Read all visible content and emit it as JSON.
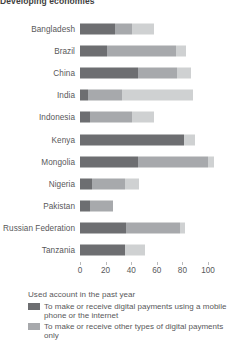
{
  "chart_data": {
    "type": "bar",
    "title": "Developing economies",
    "orientation": "horizontal",
    "stacked": true,
    "xlabel": "",
    "ylabel": "",
    "xlim": [
      0,
      100
    ],
    "xticks": [
      0,
      20,
      40,
      60,
      80,
      100
    ],
    "grid": false,
    "legend_position": "bottom-left",
    "legend_title": "Used account in the past year",
    "categories": [
      "Bangladesh",
      "Brazil",
      "China",
      "India",
      "Indonesia",
      "Kenya",
      "Mongolia",
      "Nigeria",
      "Pakistan",
      "Russian Federation",
      "Tanzania"
    ],
    "series": [
      {
        "name": "To make or receive digital payments using a mobile phone or the internet",
        "color": "#6d6e71",
        "values": [
          27,
          21,
          45,
          6,
          8,
          81,
          45,
          9,
          8,
          36,
          35
        ]
      },
      {
        "name": "To make or receive other types of digital payments only",
        "color": "#a7a9ac",
        "values": [
          14,
          54,
          31,
          27,
          33,
          0,
          55,
          26,
          18,
          42,
          0
        ]
      },
      {
        "name": "Other account use",
        "color": "#cfd1d2",
        "values": [
          17,
          8,
          11,
          55,
          17,
          9,
          5,
          11,
          0,
          4,
          16
        ]
      }
    ]
  },
  "legend": {
    "title": "Used account in the past year",
    "items": [
      {
        "swatch": "c1",
        "label": "To make or receive digital payments using a mobile phone or the internet"
      },
      {
        "swatch": "c2",
        "label": "To make or receive other types of digital payments only"
      }
    ]
  }
}
